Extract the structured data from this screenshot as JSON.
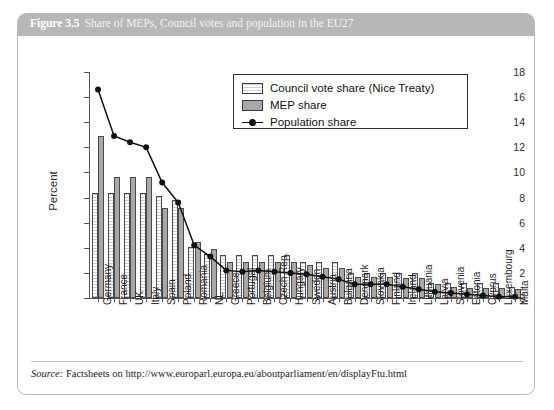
{
  "figure": {
    "number": "Figure 3.5",
    "caption": "Share of MEPs, Council votes and population in the EU27",
    "source_word": "Source:",
    "source_text": "Factsheets on http://www.europarl.europa.eu/aboutparliament/en/displayFtu.html"
  },
  "legend": {
    "council_label": "Council vote share (Nice Treaty)",
    "mep_label": "MEP share",
    "population_label": "Population share"
  },
  "colors": {
    "header_bar": "#b7b7b7",
    "mep_bar": "#a8a8a8",
    "council_bar": "#ffffff",
    "line": "#111111",
    "axis": "#555555"
  },
  "chart_data": {
    "type": "bar",
    "title": "Share of MEPs, Council votes and population in the EU27",
    "xlabel": "",
    "ylabel": "Percent",
    "ylim": [
      0,
      18
    ],
    "yticks": [
      0,
      2,
      4,
      6,
      8,
      10,
      12,
      14,
      16,
      18
    ],
    "grid": false,
    "legend_position": "upper right",
    "categories": [
      "Germany",
      "France",
      "UK",
      "Italy",
      "Spain",
      "Poland",
      "Romania",
      "NL",
      "Greece",
      "Portugal",
      "Belgium",
      "Czech Rep.",
      "Hungary",
      "Sweden",
      "Austria",
      "Bulgaria",
      "Denmark",
      "Slovakia",
      "Finland",
      "Ireland",
      "Lithuania",
      "Latvia",
      "Slovenia",
      "Estonia",
      "Cyprus",
      "Luxembourg",
      "Malta"
    ],
    "series": [
      {
        "name": "Council vote share (Nice Treaty)",
        "type": "bar",
        "values": [
          8.4,
          8.4,
          8.4,
          8.4,
          8.1,
          7.8,
          4.1,
          3.5,
          3.4,
          3.4,
          3.4,
          3.4,
          3.4,
          2.9,
          2.9,
          2.9,
          2.0,
          2.0,
          2.0,
          2.0,
          2.0,
          1.2,
          1.2,
          1.2,
          1.2,
          1.2,
          0.9
        ]
      },
      {
        "name": "MEP share",
        "type": "bar",
        "values": [
          12.9,
          9.6,
          9.6,
          9.6,
          7.2,
          7.2,
          4.5,
          3.9,
          2.9,
          2.9,
          2.9,
          2.9,
          2.9,
          2.6,
          2.4,
          2.4,
          1.7,
          1.7,
          1.7,
          1.6,
          1.6,
          1.1,
          0.9,
          0.8,
          0.8,
          0.8,
          0.7
        ]
      },
      {
        "name": "Population share",
        "type": "line",
        "values": [
          16.6,
          12.9,
          12.4,
          12.0,
          9.2,
          7.6,
          4.2,
          3.3,
          2.2,
          2.1,
          2.2,
          2.1,
          2.0,
          1.9,
          1.7,
          1.5,
          1.1,
          1.1,
          1.1,
          0.9,
          0.7,
          0.5,
          0.4,
          0.3,
          0.2,
          0.1,
          0.1
        ]
      }
    ]
  }
}
